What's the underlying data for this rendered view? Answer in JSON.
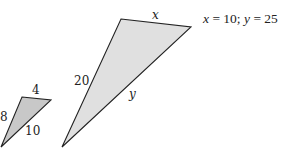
{
  "diagram": {
    "type": "similar-triangles",
    "small_triangle": {
      "fill": "#c8c8c8",
      "stroke": "#222222",
      "vertices": [
        [
          22,
          97
        ],
        [
          51,
          100
        ],
        [
          1,
          147
        ]
      ],
      "sides": {
        "top": "4",
        "left": "8",
        "right": "10"
      }
    },
    "large_triangle": {
      "fill": "#e0e0e0",
      "stroke": "#222222",
      "vertices": [
        [
          121,
          19
        ],
        [
          191,
          27
        ],
        [
          62,
          147
        ]
      ],
      "sides": {
        "top": "x",
        "left": "20",
        "right": "y"
      }
    },
    "answer": {
      "x_var": "x",
      "eq1": " = 10; ",
      "y_var": "y",
      "eq2": " = 25"
    }
  }
}
